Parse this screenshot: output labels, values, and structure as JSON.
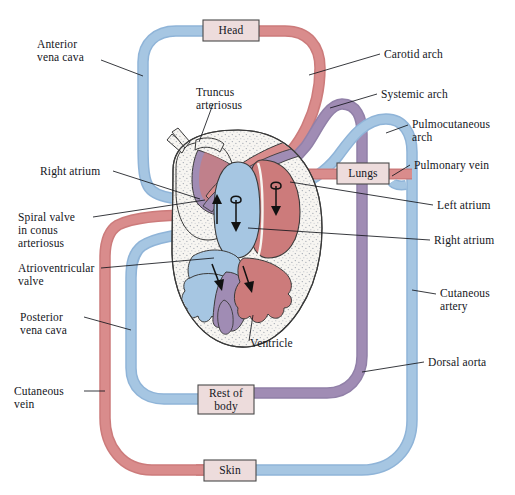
{
  "figure": {
    "background": "#ffffff"
  },
  "colors": {
    "deoxygenated_blue": "#a6c6e2",
    "deoxygenated_blue_dark": "#8fb4d8",
    "oxygenated_red": "#d98c8c",
    "oxygenated_red_dark": "#cc7b7b",
    "mixed_purple": "#a08cb4",
    "mixed_purple_dark": "#9180a8",
    "heart_wall": "#f4f2ee",
    "box_fill": "#eddcdc",
    "outline": "#2a2a2a",
    "leader_line": "#14161c",
    "text": "#14161c"
  },
  "organ_boxes": [
    {
      "id": "head",
      "label": "Head",
      "x": 203,
      "y": 20,
      "w": 56,
      "h": 21
    },
    {
      "id": "lungs",
      "label": "Lungs",
      "x": 337,
      "y": 163,
      "w": 52,
      "h": 21
    },
    {
      "id": "rest_of_body",
      "label": "Rest of\nbody",
      "x": 198,
      "y": 385,
      "w": 56,
      "h": 29
    },
    {
      "id": "skin",
      "label": "Skin",
      "x": 204,
      "y": 460,
      "w": 52,
      "h": 21
    }
  ],
  "labels_left": [
    {
      "id": "anterior-vena-cava",
      "text": "Anterior\nvena cava",
      "x": 37,
      "y": 44
    },
    {
      "id": "truncus-arteriosus",
      "text": "Truncus\narteriosus",
      "x": 196,
      "y": 86
    },
    {
      "id": "right-atrium-left",
      "text": "Right atrium",
      "x": 40,
      "y": 168
    },
    {
      "id": "spiral-valve-conus-arteriosus",
      "text": "Spiral valve\nin conus\narteriosus",
      "x": 18,
      "y": 214
    },
    {
      "id": "atrioventricular-valve",
      "text": "Atrioventricular\nvalve",
      "x": 18,
      "y": 265
    },
    {
      "id": "posterior-vena-cava",
      "text": "Posterior\nvena cava",
      "x": 20,
      "y": 313
    },
    {
      "id": "cutaneous-vein",
      "text": "Cutaneous\nvein",
      "x": 14,
      "y": 388
    },
    {
      "id": "ventricle",
      "text": "Ventricle",
      "x": 250,
      "y": 340
    }
  ],
  "labels_right": [
    {
      "id": "carotid-arch",
      "text": "Carotid arch",
      "x": 384,
      "y": 50
    },
    {
      "id": "systemic-arch",
      "text": "Systemic arch",
      "x": 381,
      "y": 90
    },
    {
      "id": "pulmocutaneous-arch",
      "text": "Pulmocutaneous\narch",
      "x": 412,
      "y": 120
    },
    {
      "id": "pulmonary-vein",
      "text": "Pulmonary vein",
      "x": 414,
      "y": 161
    },
    {
      "id": "left-atrium",
      "text": "Left atrium",
      "x": 437,
      "y": 201
    },
    {
      "id": "right-atrium-right",
      "text": "Right atrium",
      "x": 434,
      "y": 236
    },
    {
      "id": "cutaneous-artery",
      "text": "Cutaneous\nartery",
      "x": 440,
      "y": 289
    },
    {
      "id": "dorsal-aorta",
      "text": "Dorsal aorta",
      "x": 428,
      "y": 358
    }
  ],
  "vessels": [
    {
      "id": "anterior-vena-cava-vessel",
      "blood": "deoxygenated",
      "color": "#a6c6e2"
    },
    {
      "id": "carotid-arch-vessel",
      "blood": "oxygenated",
      "color": "#d98c8c"
    },
    {
      "id": "systemic-arch-vessel",
      "blood": "mixed",
      "color": "#a08cb4"
    },
    {
      "id": "pulmocutaneous-arch-vessel",
      "blood": "deoxygenated",
      "color": "#a6c6e2"
    },
    {
      "id": "pulmonary-vein-vessel",
      "blood": "oxygenated",
      "color": "#d98c8c"
    },
    {
      "id": "posterior-vena-cava-vessel",
      "blood": "deoxygenated",
      "color": "#a6c6e2"
    },
    {
      "id": "cutaneous-vein-vessel",
      "blood": "oxygenated",
      "color": "#d98c8c"
    },
    {
      "id": "cutaneous-artery-vessel",
      "blood": "deoxygenated",
      "color": "#a6c6e2"
    },
    {
      "id": "dorsal-aorta-vessel",
      "blood": "mixed",
      "color": "#a08cb4"
    }
  ],
  "heart_chambers": [
    {
      "id": "left-atrium-chamber",
      "blood": "oxygenated",
      "color": "#cc7b7b"
    },
    {
      "id": "right-atrium-chamber",
      "blood": "deoxygenated",
      "color": "#a6c6e2"
    },
    {
      "id": "ventricle-chamber",
      "blood": "mixed",
      "color": "#cc7b7b"
    },
    {
      "id": "conus-arteriosus",
      "blood": "mixed",
      "color": "#a08cb4"
    }
  ]
}
